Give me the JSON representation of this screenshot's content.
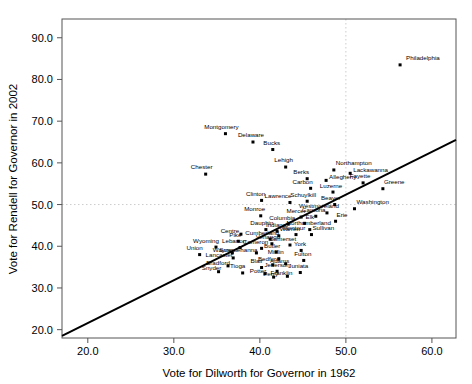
{
  "chart_data": {
    "type": "scatter",
    "title": "",
    "xlabel": "Vote for Dilworth for Governor in 1962",
    "ylabel": "Vote for Rendell for Governor in 2002",
    "xlim": [
      17.0,
      62.8
    ],
    "ylim": [
      18.0,
      94.5
    ],
    "xticks": [
      "20.0",
      "30.0",
      "40.0",
      "50.0",
      "60.0"
    ],
    "xtick_values": [
      20.0,
      30.0,
      40.0,
      50.0,
      60.0
    ],
    "yticks": [
      "20.0",
      "30.0",
      "40.0",
      "50.0",
      "60.0",
      "70.0",
      "80.0",
      "90.0"
    ],
    "ytick_values": [
      20.0,
      30.0,
      40.0,
      50.0,
      60.0,
      70.0,
      80.0,
      90.0
    ],
    "grid": true,
    "gridlines": {
      "vertical_at_x": 50.0,
      "horizontal_at_y": 50.0
    },
    "legend": "none",
    "regression_line": {
      "x_start": 17.0,
      "y_start": 18.5,
      "x_end": 62.8,
      "y_end": 65.5,
      "color": "#000000"
    },
    "marker_color": "#000000",
    "points": [
      {
        "label": "Philadelphia",
        "x": 56.3,
        "y": 83.5,
        "lx": 6,
        "ly": -5
      },
      {
        "label": "Montgomery",
        "x": 36.0,
        "y": 67.0,
        "lx": -4,
        "ly": -5
      },
      {
        "label": "Delaware",
        "x": 39.2,
        "y": 65.0,
        "lx": -2,
        "ly": -5
      },
      {
        "label": "Bucks",
        "x": 41.5,
        "y": 63.2,
        "lx": -1,
        "ly": -5
      },
      {
        "label": "Chester",
        "x": 33.7,
        "y": 57.3,
        "lx": -4,
        "ly": -5
      },
      {
        "label": "Lehigh",
        "x": 43.0,
        "y": 59.0,
        "lx": -2,
        "ly": -5
      },
      {
        "label": "Northampton",
        "x": 48.6,
        "y": 58.3,
        "lx": 2,
        "ly": -5
      },
      {
        "label": "Lackawanna",
        "x": 50.5,
        "y": 57.5,
        "lx": 3,
        "ly": -1.2
      },
      {
        "label": "Berks",
        "x": 45.5,
        "y": 56.2,
        "lx": -6,
        "ly": -4.5
      },
      {
        "label": "Allegheny",
        "x": 47.7,
        "y": 55.8,
        "lx": 3,
        "ly": -1.2
      },
      {
        "label": "Fayette",
        "x": 52.0,
        "y": 55.2,
        "lx": -3,
        "ly": -4.5
      },
      {
        "label": "Greene",
        "x": 54.3,
        "y": 53.8,
        "lx": 1,
        "ly": -4.5
      },
      {
        "label": "Carbon",
        "x": 45.9,
        "y": 53.9,
        "lx": -8,
        "ly": -4.5
      },
      {
        "label": "Luzerne",
        "x": 48.5,
        "y": 53.0,
        "lx": -2,
        "ly": -4.5
      },
      {
        "label": "Schuylkill",
        "x": 45.5,
        "y": 50.8,
        "lx": -4,
        "ly": -4.5
      },
      {
        "label": "Lawrence",
        "x": 43.5,
        "y": 50.5,
        "lx": -12,
        "ly": -4.5
      },
      {
        "label": "Beaver",
        "x": 48.7,
        "y": 50.0,
        "lx": -4,
        "ly": -4.5
      },
      {
        "label": "Clinton",
        "x": 40.2,
        "y": 51.0,
        "lx": -6,
        "ly": -4.5
      },
      {
        "label": "Washington",
        "x": 51.0,
        "y": 49.0,
        "lx": 2,
        "ly": -4.5
      },
      {
        "label": "Westmoreland",
        "x": 47.8,
        "y": 48.0,
        "lx": -8,
        "ly": -4.5
      },
      {
        "label": "Cambria",
        "x": 46.5,
        "y": 47.2,
        "lx": -2,
        "ly": -4.5
      },
      {
        "label": "Mercer",
        "x": 44.8,
        "y": 47.0,
        "lx": -5,
        "ly": -4.5
      },
      {
        "label": "Monroe",
        "x": 40.1,
        "y": 47.3,
        "lx": -6,
        "ly": -4.5
      },
      {
        "label": "Erie",
        "x": 48.8,
        "y": 46.0,
        "lx": 1,
        "ly": -4.5
      },
      {
        "label": "Elk",
        "x": 45.2,
        "y": 45.5,
        "lx": 1,
        "ly": -4.5
      },
      {
        "label": "Columbia",
        "x": 43.3,
        "y": 45.3,
        "lx": -6,
        "ly": -4.5
      },
      {
        "label": "Northumberland",
        "x": 45.8,
        "y": 44.0,
        "lx": -1,
        "ly": -4.5
      },
      {
        "label": "Montour",
        "x": 44.2,
        "y": 42.8,
        "lx": -2,
        "ly": -4.5
      },
      {
        "label": "Sullivan",
        "x": 46.0,
        "y": 42.8,
        "lx": 1,
        "ly": -4.5
      },
      {
        "label": "Dauphin",
        "x": 40.7,
        "y": 44.0,
        "lx": -4,
        "ly": -4.5
      },
      {
        "label": "Indiana",
        "x": 42.0,
        "y": 43.6,
        "lx": -1,
        "ly": -4.5
      },
      {
        "label": "Warren",
        "x": 42.2,
        "y": 42.5,
        "lx": 1,
        "ly": -4.5
      },
      {
        "label": "Centre",
        "x": 37.8,
        "y": 42.9,
        "lx": -11,
        "ly": -1.2
      },
      {
        "label": "Cumberland",
        "x": 41.2,
        "y": 41.7,
        "lx": -8,
        "ly": -4.5
      },
      {
        "label": "Pike",
        "x": 37.5,
        "y": 41.2,
        "lx": -3,
        "ly": -4.5
      },
      {
        "label": "Venango",
        "x": 41.4,
        "y": 40.6,
        "lx": -4,
        "ly": -4.5
      },
      {
        "label": "Somerset",
        "x": 43.5,
        "y": 40.3,
        "lx": -7,
        "ly": -4.5
      },
      {
        "label": "Wyoming",
        "x": 34.9,
        "y": 39.8,
        "lx": -10,
        "ly": -4.5
      },
      {
        "label": "Lebanon",
        "x": 37.7,
        "y": 39.7,
        "lx": -6,
        "ly": -4.5
      },
      {
        "label": "Cameron",
        "x": 40.2,
        "y": 39.5,
        "lx": -6,
        "ly": -4.5
      },
      {
        "label": "York",
        "x": 44.8,
        "y": 39.0,
        "lx": -1,
        "ly": -4.5
      },
      {
        "label": "Butler",
        "x": 41.9,
        "y": 38.6,
        "lx": -4,
        "ly": -4.5
      },
      {
        "label": "Union",
        "x": 33.0,
        "y": 38.0,
        "lx": -5,
        "ly": -4.5
      },
      {
        "label": "Wayne",
        "x": 36.8,
        "y": 38.4,
        "lx": -10,
        "ly": -1.2
      },
      {
        "label": "Susquehanna",
        "x": 39.6,
        "y": 38.4,
        "lx": -18,
        "ly": -1.2
      },
      {
        "label": "Lancaster",
        "x": 36.9,
        "y": 37.2,
        "lx": -14,
        "ly": -1.2
      },
      {
        "label": "Mifflin",
        "x": 42.2,
        "y": 37.0,
        "lx": -3,
        "ly": -4.5
      },
      {
        "label": "Fulton",
        "x": 45.1,
        "y": 36.6,
        "lx": -1,
        "ly": -4.5
      },
      {
        "label": "Adams",
        "x": 43.0,
        "y": 35.8,
        "lx": -6,
        "ly": -1.2
      },
      {
        "label": "Bedford",
        "x": 41.5,
        "y": 35.5,
        "lx": -4,
        "ly": -4.5
      },
      {
        "label": "Bradford",
        "x": 36.3,
        "y": 35.3,
        "lx": -10,
        "ly": -1.2
      },
      {
        "label": "Blair",
        "x": 40.2,
        "y": 34.9,
        "lx": -5,
        "ly": -4.5
      },
      {
        "label": "Jefferson",
        "x": 42.0,
        "y": 34.0,
        "lx": 0,
        "ly": -4.5
      },
      {
        "label": "Juniata",
        "x": 44.7,
        "y": 33.7,
        "lx": -2,
        "ly": -4.5
      },
      {
        "label": "Tioga",
        "x": 38.0,
        "y": 33.6,
        "lx": -5,
        "ly": -4.5
      },
      {
        "label": "Potter",
        "x": 40.6,
        "y": 33.4,
        "lx": -7,
        "ly": -1.2
      },
      {
        "label": "Snyder",
        "x": 35.2,
        "y": 33.9,
        "lx": -7,
        "ly": -1.2
      },
      {
        "label": "Franklin",
        "x": 43.2,
        "y": 32.8,
        "lx": -6,
        "ly": -1.2
      },
      {
        "label": "Perry",
        "x": 41.6,
        "y": 32.6,
        "lx": -3,
        "ly": -1.2
      }
    ]
  }
}
